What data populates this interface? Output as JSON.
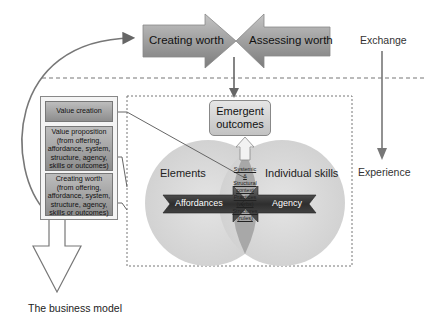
{
  "top_arrows": {
    "left": "Creating worth",
    "right": "Assessing worth"
  },
  "side_axis": {
    "top": "Exchange",
    "bottom": "Experience"
  },
  "left_column": {
    "boxes": [
      {
        "label": "Value creation"
      },
      {
        "label": "Value proposition (from offering, affordance, system, structure, agency, skills or outcomes)"
      },
      {
        "label": "Creating worth (from offering, affordance, system, structure, agency, skills or outcomes)"
      }
    ],
    "footer": "The business model"
  },
  "center": {
    "emergent": "Emergent outcomes",
    "left_circle": "Elements",
    "right_circle": "Individual skills",
    "left_arrow": "Affordances",
    "right_arrow": "Agency",
    "overlap_lines": [
      "Systemic",
      "&",
      "Structural",
      "context",
      "Practices",
      "(verbs)",
      "Structures",
      "(rules)"
    ]
  },
  "colors": {
    "arrow_fill_top": "#b5b5b5",
    "arrow_fill_bottom": "#7a7a7a",
    "circle_fill": "#d8d8d8",
    "overlap_fill": "#9a9a9a",
    "dark_arrow": "#3a3a3a",
    "line": "#777777"
  }
}
